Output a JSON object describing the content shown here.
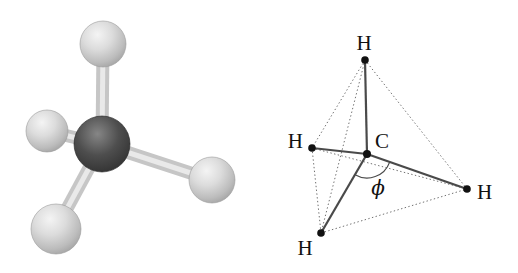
{
  "figure": {
    "ball_and_stick_model": {
      "molecule": "methane-3d-model",
      "carbon_color": "#3d3d3d",
      "hydrogen_color": "#c9c9c9",
      "bond_color": "#d6d6d6"
    },
    "tetrahedron_diagram": {
      "labels": {
        "top": "H",
        "left": "H",
        "bottom": "H",
        "right": "H",
        "center": "C"
      },
      "angle_label": "ϕ",
      "solid_line_color": "#4a4a4a",
      "dotted_line_color": "#707070",
      "dot_color": "#111111"
    }
  }
}
